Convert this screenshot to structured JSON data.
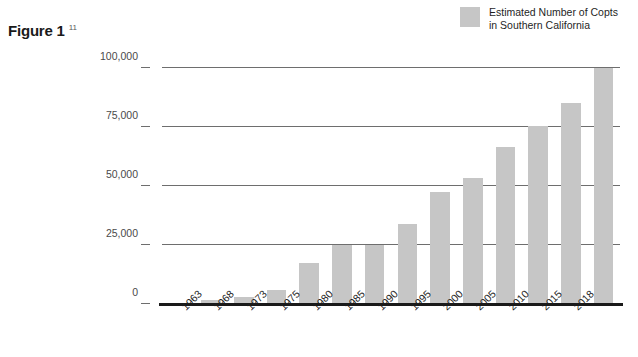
{
  "figure": {
    "title": "Figure 1",
    "footnote_marker": "11"
  },
  "legend": {
    "label": "Estimated Number of Copts in Southern California",
    "swatch_color": "#c6c6c6",
    "position": "top-right"
  },
  "colors": {
    "bar": "#c6c6c6",
    "gridline": "#6e6e6e",
    "axis": "#1a1a1a",
    "tick_text": "#4a4a4a",
    "label_text": "#1f1f1f",
    "background": "#ffffff"
  },
  "chart_data": {
    "type": "bar",
    "title": "Figure 1",
    "xlabel": "",
    "ylabel": "",
    "ylim": [
      0,
      100000
    ],
    "yticks": [
      0,
      25000,
      50000,
      75000,
      100000
    ],
    "ytick_labels": [
      "0",
      "25,000",
      "50,000",
      "75,000",
      "100,000"
    ],
    "grid": true,
    "legend_position": "top-right",
    "categories": [
      "1963",
      "1968",
      "1973",
      "1975",
      "1980",
      "1985",
      "1990",
      "1995",
      "2000",
      "2005",
      "2010",
      "2015",
      "2018"
    ],
    "series": [
      {
        "name": "Estimated Number of Copts in Southern California",
        "color": "#c6c6c6",
        "values": [
          500,
          1500,
          3000,
          6000,
          17500,
          25000,
          25000,
          34000,
          47500,
          53500,
          66500,
          75500,
          85000
        ]
      }
    ],
    "extra_bars": [
      {
        "label": "",
        "value": 100000
      }
    ]
  }
}
